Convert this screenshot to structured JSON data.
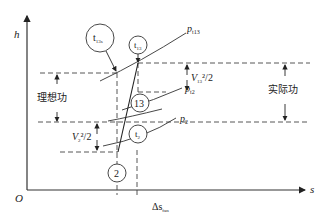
{
  "diagram": {
    "type": "h-s enthalpy-entropy diagram",
    "axes": {
      "y_label": "h",
      "x_label": "s",
      "origin_label": "O"
    },
    "entropy_increment_label": {
      "base": "Δs",
      "subscript": "fan"
    },
    "states": [
      {
        "id": "t13s",
        "base": "t",
        "subscript": "13s"
      },
      {
        "id": "t13",
        "base": "t",
        "subscript": "13"
      },
      {
        "id": "13",
        "label": "13"
      },
      {
        "id": "t2",
        "base": "t",
        "subscript": "2"
      },
      {
        "id": "2",
        "label": "2"
      }
    ],
    "isobars": [
      {
        "id": "p_t13",
        "base": "p",
        "subscript": "t13"
      },
      {
        "id": "p_t2",
        "base": "p",
        "subscript": "t2"
      },
      {
        "id": "p_2",
        "base": "p",
        "subscript": "2"
      }
    ],
    "annotations": {
      "ideal_work": "理想功",
      "actual_work": "实际功",
      "v13_kinetic": {
        "base": "V",
        "subscript": "13",
        "suffix": "²/2"
      },
      "v2_kinetic": {
        "base": "V",
        "subscript": "2",
        "suffix": "²/2"
      }
    }
  }
}
